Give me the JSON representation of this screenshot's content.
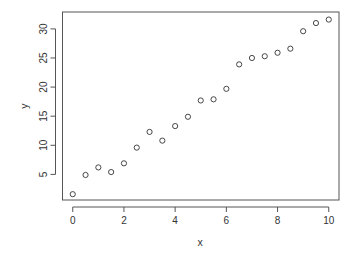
{
  "chart_data": {
    "type": "scatter",
    "title": "",
    "xlabel": "x",
    "ylabel": "y",
    "xlim": [
      -0.4,
      10.4
    ],
    "ylim": [
      0.6,
      32.9
    ],
    "grid": false,
    "legend": null,
    "x_ticks": [
      0,
      2,
      4,
      6,
      8,
      10
    ],
    "x_tick_labels": [
      "0",
      "2",
      "4",
      "6",
      "8",
      "10"
    ],
    "y_ticks": [
      5,
      10,
      15,
      20,
      25,
      30
    ],
    "y_tick_labels": [
      "5",
      "10",
      "15",
      "20",
      "25",
      "30"
    ],
    "marker": "open-circle",
    "marker_color": "#333333",
    "x": [
      0,
      0.5,
      1,
      1.5,
      2,
      2.5,
      3,
      3.5,
      4,
      4.5,
      5,
      5.5,
      6,
      6.5,
      7,
      7.5,
      8,
      8.5,
      9,
      9.5,
      10
    ],
    "y": [
      1.6,
      4.9,
      6.2,
      5.4,
      6.9,
      9.6,
      12.3,
      10.8,
      13.3,
      14.9,
      17.7,
      17.9,
      19.7,
      23.9,
      25.0,
      25.3,
      25.9,
      26.6,
      29.6,
      31.0,
      31.6
    ]
  }
}
